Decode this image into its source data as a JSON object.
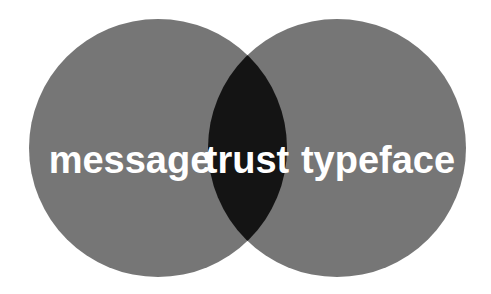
{
  "diagram": {
    "type": "venn",
    "sets": [
      {
        "label": "message",
        "color": "#767676"
      },
      {
        "label": "typeface",
        "color": "#767676"
      }
    ],
    "intersection": {
      "label": "trust",
      "color": "#141414"
    },
    "background": "#ffffff",
    "text_color": "#ffffff"
  }
}
